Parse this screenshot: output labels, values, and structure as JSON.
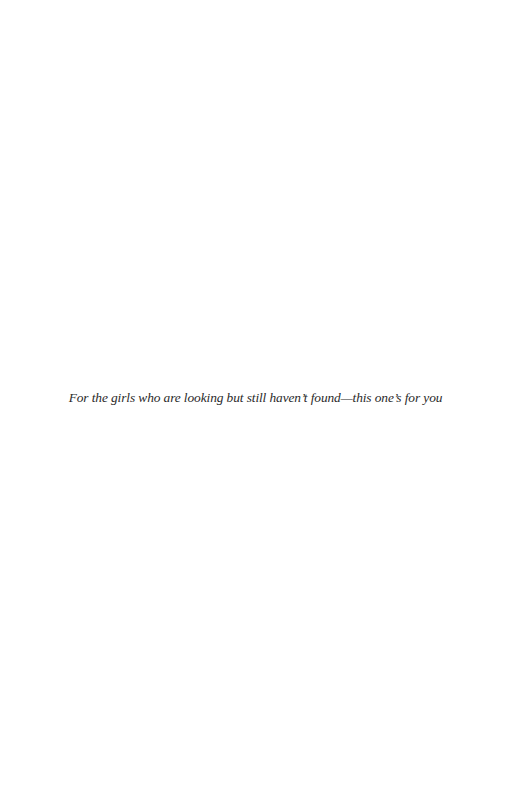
{
  "page": {
    "background": "#ffffff",
    "dedication": {
      "text": "For the girls who are looking but still haven’t found—this one’s for you",
      "color": "#2a2a2a",
      "style": "italic"
    }
  }
}
